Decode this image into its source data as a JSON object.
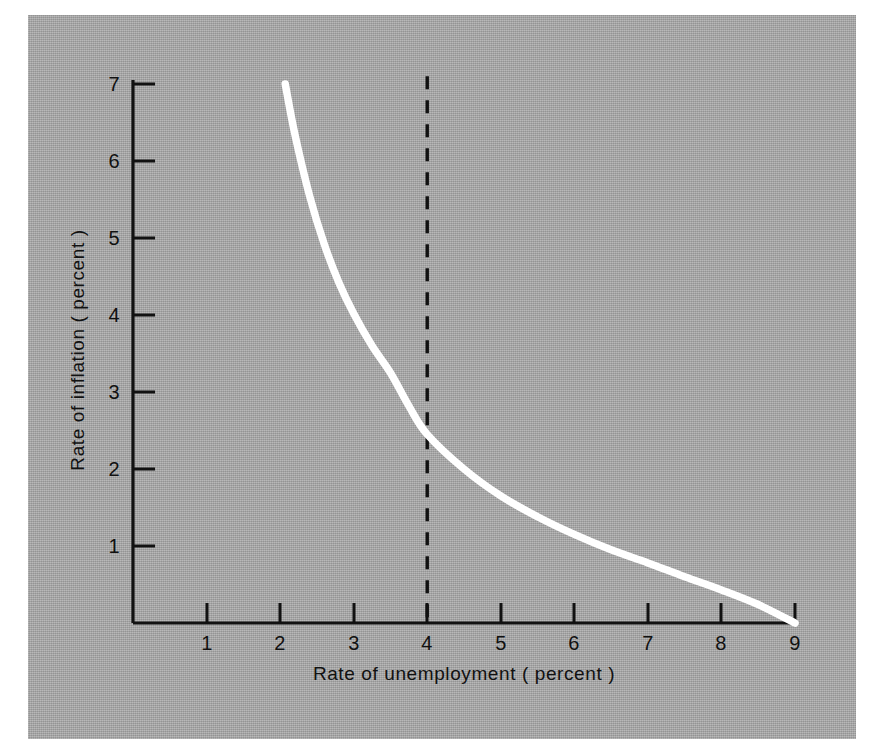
{
  "figure": {
    "background_color": "#ffffff",
    "panel_color": "#a3a3a3",
    "curve_color": "#ffffff",
    "axis_color": "#111111"
  },
  "axes": {
    "x": {
      "title": "Rate of unemployment ( percent )",
      "ticks": [
        "1",
        "2",
        "3",
        "4",
        "5",
        "6",
        "7",
        "8",
        "9"
      ],
      "tick_values": [
        1,
        2,
        3,
        4,
        5,
        6,
        7,
        8,
        9
      ],
      "min": 0,
      "max": 9
    },
    "y": {
      "title": "Rate of inflation ( percent )",
      "ticks": [
        "1",
        "2",
        "3",
        "4",
        "5",
        "6",
        "7"
      ],
      "tick_values": [
        1,
        2,
        3,
        4,
        5,
        6,
        7
      ],
      "min": 0,
      "max": 7
    }
  },
  "annotations": {
    "reference_line": {
      "name": "natural-rate-line",
      "orientation": "vertical",
      "x_value": 4,
      "style": "dashed",
      "color": "#111111"
    }
  },
  "chart_data": {
    "type": "line",
    "title": "",
    "xlabel": "Rate of unemployment ( percent )",
    "ylabel": "Rate of inflation ( percent )",
    "xlim": [
      0,
      9
    ],
    "ylim": [
      0,
      7
    ],
    "grid": false,
    "legend": "none",
    "series": [
      {
        "name": "Phillips curve",
        "color": "#ffffff",
        "x": [
          2.07,
          2.2,
          2.4,
          2.6,
          2.8,
          3.0,
          3.25,
          3.5,
          3.75,
          4.0,
          4.5,
          5.0,
          5.5,
          6.0,
          6.5,
          7.0,
          7.5,
          8.0,
          8.5,
          9.0
        ],
        "y": [
          7.0,
          6.35,
          5.55,
          4.92,
          4.42,
          4.02,
          3.6,
          3.25,
          2.82,
          2.45,
          2.0,
          1.65,
          1.38,
          1.15,
          0.95,
          0.78,
          0.6,
          0.43,
          0.24,
          0.0
        ]
      }
    ],
    "annotations": [
      {
        "type": "vline",
        "x": 4,
        "label": "",
        "style": "dashed",
        "y_from": 0,
        "y_to": 7.1
      }
    ]
  }
}
